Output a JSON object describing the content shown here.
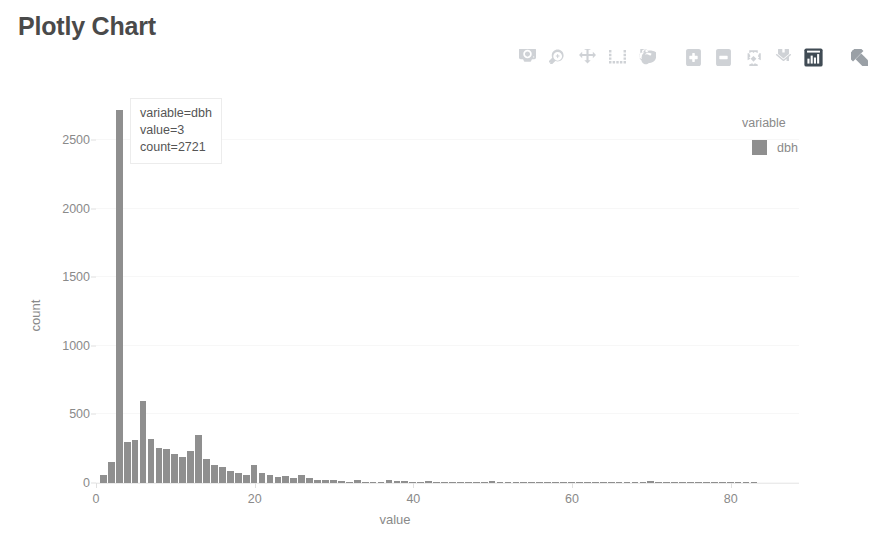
{
  "page": {
    "title": "Plotly Chart"
  },
  "modebar": {
    "buttons": [
      {
        "name": "download-plot-as-png-icon",
        "label": "Download plot as a png"
      },
      {
        "name": "zoom-icon",
        "label": "Zoom"
      },
      {
        "name": "pan-icon",
        "label": "Pan"
      },
      {
        "name": "box-select-icon",
        "label": "Box Select"
      },
      {
        "name": "lasso-select-icon",
        "label": "Lasso Select"
      },
      {
        "name": "zoom-in-icon",
        "label": "Zoom in"
      },
      {
        "name": "zoom-out-icon",
        "label": "Zoom out"
      },
      {
        "name": "autoscale-icon",
        "label": "Autoscale"
      },
      {
        "name": "reset-axes-home-icon",
        "label": "Reset axes"
      },
      {
        "name": "plotly-logo-icon",
        "label": "Produced with Plotly"
      },
      {
        "name": "expand-icon",
        "label": "Expand"
      }
    ]
  },
  "tooltip": {
    "lines": [
      "variable=dbh",
      "value=3",
      "count=2721"
    ],
    "line1": "variable=dbh",
    "line2": "value=3",
    "line3": "count=2721"
  },
  "legend": {
    "title": "variable",
    "items": [
      {
        "label": "dbh",
        "color": "#8f8f8f"
      }
    ]
  },
  "colors": {
    "bar": "#8f8f8f",
    "tick_text": "#8a8a8a",
    "title_text": "#4a4a4a",
    "gridline": "#f7f7f7",
    "axis_line": "#ebebeb",
    "modebar_icon": "#cfd2d6",
    "modebar_icon_active": "#404b54"
  },
  "chart_data": {
    "type": "bar",
    "title": "Plotly Chart",
    "xlabel": "value",
    "ylabel": "count",
    "xlim": [
      0,
      88.6
    ],
    "ylim": [
      0,
      2850
    ],
    "xticks": [
      0,
      20,
      40,
      60,
      80
    ],
    "yticks": [
      0,
      500,
      1000,
      1500,
      2000,
      2500
    ],
    "grid": true,
    "legend_position": "right",
    "bin_width": 1,
    "series": [
      {
        "name": "dbh",
        "color": "#8f8f8f",
        "x": [
          1,
          2,
          3,
          4,
          5,
          6,
          7,
          8,
          9,
          10,
          11,
          12,
          13,
          14,
          15,
          16,
          17,
          18,
          19,
          20,
          21,
          22,
          23,
          24,
          25,
          26,
          27,
          28,
          29,
          30,
          31,
          32,
          33,
          34,
          35,
          36,
          37,
          38,
          39,
          40,
          41,
          42,
          43,
          44,
          45,
          46,
          47,
          48,
          49,
          50,
          51,
          52,
          53,
          54,
          55,
          56,
          57,
          58,
          59,
          60,
          61,
          62,
          63,
          64,
          65,
          66,
          67,
          68,
          69,
          70,
          71,
          72,
          73,
          74,
          75,
          76,
          77,
          78,
          79,
          80,
          81,
          82,
          83
        ],
        "values": [
          60,
          150,
          2721,
          300,
          310,
          600,
          320,
          255,
          250,
          215,
          190,
          230,
          350,
          175,
          130,
          115,
          85,
          70,
          60,
          130,
          70,
          55,
          45,
          50,
          40,
          55,
          35,
          25,
          20,
          22,
          12,
          10,
          22,
          10,
          9,
          8,
          25,
          12,
          14,
          10,
          8,
          12,
          8,
          6,
          10,
          5,
          5,
          6,
          4,
          14,
          6,
          4,
          5,
          4,
          3,
          3,
          4,
          3,
          3,
          10,
          3,
          2,
          3,
          2,
          3,
          2,
          2,
          2,
          2,
          12,
          2,
          2,
          2,
          2,
          2,
          2,
          2,
          2,
          2,
          10,
          2,
          2,
          9
        ],
        "highlighted": {
          "value": 3,
          "count": 2721
        }
      }
    ]
  }
}
